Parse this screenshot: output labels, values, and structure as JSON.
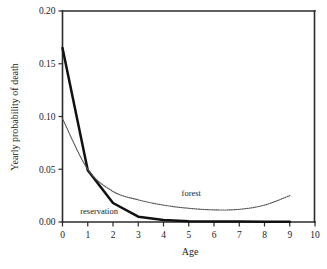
{
  "chart_data": {
    "type": "line",
    "title": "",
    "xlabel": "Age",
    "ylabel": "Yearly probability of death",
    "xlim": [
      0,
      10
    ],
    "ylim": [
      0,
      0.2
    ],
    "grid": false,
    "legend_position": "inline-annotations",
    "x_ticks": [
      "0",
      "1",
      "2",
      "3",
      "4",
      "5",
      "6",
      "7",
      "8",
      "9",
      "10"
    ],
    "x_tick_values": [
      0,
      1,
      2,
      3,
      4,
      5,
      6,
      7,
      8,
      9,
      10
    ],
    "y_ticks": [
      "0.00",
      "0.05",
      "0.10",
      "0.15",
      "0.20"
    ],
    "y_tick_values": [
      0.0,
      0.05,
      0.1,
      0.15,
      0.2
    ],
    "series": [
      {
        "name": "reservation",
        "style": "solid-thick",
        "color": "#111111",
        "x": [
          0,
          1,
          2,
          3,
          4,
          5,
          6,
          7,
          8,
          9
        ],
        "values": [
          0.165,
          0.049,
          0.018,
          0.005,
          0.002,
          0.0008,
          0.0005,
          0.0004,
          0.0003,
          0.0003
        ]
      },
      {
        "name": "forest",
        "style": "dotted",
        "color": "#555555",
        "x": [
          0,
          1,
          2,
          3,
          4,
          5,
          6,
          7,
          8,
          9
        ],
        "values": [
          0.098,
          0.05,
          0.029,
          0.021,
          0.016,
          0.013,
          0.0115,
          0.012,
          0.016,
          0.025
        ]
      }
    ],
    "annotations": [
      {
        "text": "reservation",
        "x": 1.45,
        "y": 0.0075
      },
      {
        "text": "forest",
        "x": 5.1,
        "y": 0.0245
      }
    ]
  }
}
